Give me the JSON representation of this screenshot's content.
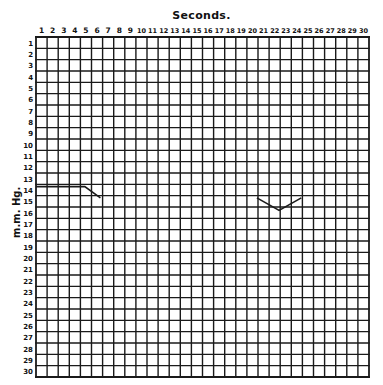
{
  "chart_data": {
    "type": "line",
    "title": "Seconds.",
    "xlabel": "Seconds.",
    "ylabel": "m.m. Hg.",
    "x_ticks": [
      1,
      2,
      3,
      4,
      5,
      6,
      7,
      8,
      9,
      10,
      11,
      12,
      13,
      14,
      15,
      16,
      17,
      18,
      19,
      20,
      21,
      22,
      23,
      24,
      25,
      26,
      27,
      28,
      29,
      30
    ],
    "y_ticks": [
      1,
      2,
      3,
      4,
      5,
      6,
      7,
      8,
      9,
      10,
      11,
      12,
      13,
      14,
      15,
      16,
      17,
      18,
      19,
      20,
      21,
      22,
      23,
      24,
      25,
      26,
      27,
      28,
      29,
      30
    ],
    "xlim": [
      0,
      30
    ],
    "ylim": [
      0,
      30
    ],
    "y_inverted": true,
    "grid": true,
    "legend": "none",
    "series": [
      {
        "name": "trace-left",
        "x": [
          0,
          4.4,
          5.8
        ],
        "y": [
          13.2,
          13.2,
          14.2
        ]
      },
      {
        "name": "trace-right",
        "x": [
          19.9,
          21.9,
          23.9
        ],
        "y": [
          14.2,
          15.3,
          14.2
        ]
      }
    ],
    "colors": {
      "grid": "#1a1a1a",
      "trace": "#1a1a1a",
      "background": "#ffffff"
    }
  },
  "labels": {
    "title": "Seconds.",
    "ylabel": "m.m. Hg."
  }
}
